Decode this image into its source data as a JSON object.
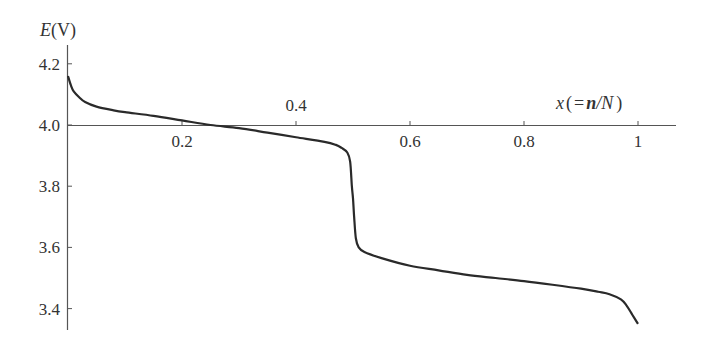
{
  "chart_data": {
    "type": "line",
    "title": "",
    "xlabel": "x(=n/N)",
    "ylabel": "E(V)",
    "xlabel_parts": {
      "var": "x",
      "open": "(",
      "eq": "=",
      "n": "n",
      "slash": "/",
      "N": "N",
      "close": ")"
    },
    "ylabel_parts": {
      "var": "E",
      "unit": "(V)"
    },
    "xlim": [
      0,
      1.06
    ],
    "ylim": [
      3.32,
      4.25
    ],
    "x_axis_crosses_y_at": 4.0,
    "grid": false,
    "legend": null,
    "x_ticks": [
      {
        "value": 0.2,
        "label": "0.2",
        "label_position": "below"
      },
      {
        "value": 0.4,
        "label": "0.4",
        "label_position": "above"
      },
      {
        "value": 0.6,
        "label": "0.6",
        "label_position": "below"
      },
      {
        "value": 0.8,
        "label": "0.8",
        "label_position": "below"
      },
      {
        "value": 1.0,
        "label": "1",
        "label_position": "below"
      }
    ],
    "y_ticks": [
      {
        "value": 4.2,
        "label": "4.2"
      },
      {
        "value": 4.0,
        "label": "4.0"
      },
      {
        "value": 3.8,
        "label": "3.8"
      },
      {
        "value": 3.6,
        "label": "3.6"
      },
      {
        "value": 3.4,
        "label": "3.4"
      }
    ],
    "series": [
      {
        "name": "E vs x",
        "color": "#2a2a2a",
        "x": [
          0.0,
          0.005,
          0.01,
          0.02,
          0.03,
          0.05,
          0.08,
          0.1,
          0.15,
          0.2,
          0.25,
          0.3,
          0.35,
          0.4,
          0.45,
          0.47,
          0.48,
          0.49,
          0.495,
          0.498,
          0.5,
          0.502,
          0.505,
          0.51,
          0.52,
          0.55,
          0.6,
          0.65,
          0.7,
          0.75,
          0.8,
          0.85,
          0.9,
          0.93,
          0.95,
          0.97,
          0.98,
          0.99,
          1.0
        ],
        "values": [
          4.16,
          4.13,
          4.11,
          4.09,
          4.075,
          4.06,
          4.048,
          4.042,
          4.03,
          4.015,
          4.0,
          3.99,
          3.975,
          3.96,
          3.945,
          3.935,
          3.925,
          3.91,
          3.88,
          3.8,
          3.76,
          3.7,
          3.63,
          3.6,
          3.585,
          3.565,
          3.54,
          3.525,
          3.51,
          3.5,
          3.49,
          3.478,
          3.465,
          3.455,
          3.447,
          3.43,
          3.41,
          3.38,
          3.35
        ]
      }
    ]
  }
}
